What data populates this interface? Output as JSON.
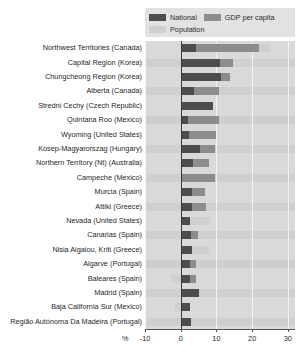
{
  "chart_data": {
    "type": "bar",
    "orientation": "horizontal",
    "stacked": true,
    "title": "",
    "subtitle": "",
    "xlabel": "%",
    "ylabel": "",
    "xlim": [
      -10,
      32
    ],
    "xticks": [
      -10,
      0,
      10,
      20,
      30
    ],
    "xtick_labels": [
      "-10",
      "0",
      "10",
      "20",
      "30"
    ],
    "grid": true,
    "grid_axis": "x",
    "legend_position": "top-right",
    "unit_label": "%",
    "legend": [
      {
        "name": "National",
        "color": "#4d4d4d"
      },
      {
        "name": "GDP per capita",
        "color": "#8c8c8c"
      },
      {
        "name": "Population",
        "color": "#cfcfcf"
      }
    ],
    "categories": [
      "Northwest Territories (Canada)",
      "Capital Region (Korea)",
      "Chungcheong Region (Korea)",
      "Alberta (Canada)",
      "Stredni Cechy (Czech Republic)",
      "Quintana Roo (Mexico)",
      "Wyoming (United States)",
      "Kosep-Magyarorszag (Hungary)",
      "Northern Territory (Nt) (Australia)",
      "Campeche (Mexico)",
      "Murcia (Spain)",
      "Attiki (Greece)",
      "Nevada (United States)",
      "Canarias  (Spain)",
      "Nisia Aigaiou, Kriti (Greece)",
      "Algarve (Portugal)",
      "Baleares (Spain)",
      "Madrid (Spain)",
      "Baja California Sur (Mexico)",
      "Região Autónoma Da Madeira (Portugal)"
    ],
    "series": [
      {
        "name": "National",
        "color": "#4d4d4d",
        "values": [
          4.2,
          11.0,
          11.3,
          3.8,
          9.0,
          2.0,
          2.4,
          5.5,
          3.4,
          0.2,
          3.2,
          3.2,
          2.6,
          2.8,
          3.2,
          2.6,
          2.6,
          5.2,
          2.6,
          2.8
        ]
      },
      {
        "name": "GDP per capita",
        "color": "#8c8c8c",
        "values": [
          17.6,
          3.5,
          2.4,
          6.8,
          0.0,
          8.8,
          7.6,
          4.0,
          4.4,
          9.5,
          3.7,
          4.0,
          0.0,
          2.0,
          0.0,
          1.6,
          1.6,
          0.0,
          0.0,
          0.0
        ]
      },
      {
        "name": "Population",
        "color": "#cfcfcf",
        "values": [
          3.0,
          0.0,
          0.0,
          0.0,
          0.0,
          0.0,
          0.0,
          0.0,
          0.0,
          0.0,
          0.0,
          0.0,
          5.6,
          2.6,
          4.6,
          2.4,
          -2.6,
          -4.2,
          -1.6,
          -2.8
        ]
      }
    ]
  }
}
